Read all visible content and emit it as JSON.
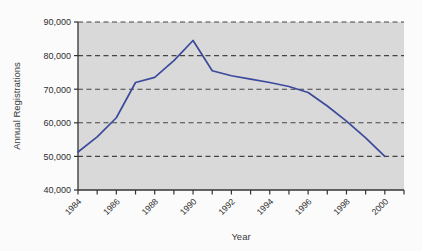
{
  "chart_data": {
    "type": "line",
    "title": "",
    "xlabel": "Year",
    "ylabel": "Annual Registrations",
    "xlim": [
      1984,
      2001
    ],
    "ylim": [
      40000,
      90000
    ],
    "grid": true,
    "grid_axis": "y",
    "legend": "none",
    "line_color": "#3b4a9c",
    "plot_background": "#d9d9d9",
    "figure_background": "#fbfbfb",
    "gridline_color": "#444444",
    "axis_color": "#333333",
    "x": [
      1984,
      1985,
      1986,
      1987,
      1988,
      1989,
      1990,
      1991,
      1992,
      1993,
      1994,
      1995,
      1996,
      1997,
      1998,
      1999,
      2000
    ],
    "values": [
      51300,
      55800,
      61500,
      72000,
      73500,
      78500,
      84500,
      75500,
      74000,
      73000,
      72000,
      70800,
      69000,
      65000,
      60500,
      55500,
      50000
    ],
    "ytick_values": [
      40000,
      50000,
      60000,
      70000,
      80000,
      90000
    ],
    "ytick_labels": [
      "40,000",
      "50,000",
      "60,000",
      "70,000",
      "80,000",
      "90,000"
    ],
    "xtick_values": [
      1984,
      1985,
      1986,
      1987,
      1988,
      1989,
      1990,
      1991,
      1992,
      1993,
      1994,
      1995,
      1996,
      1997,
      1998,
      1999,
      2000,
      2001
    ],
    "xtick_labeled": [
      1984,
      1986,
      1988,
      1990,
      1992,
      1994,
      1996,
      1998,
      2000
    ],
    "xtick_labels": [
      "1984",
      "1986",
      "1988",
      "1990",
      "1992",
      "1994",
      "1996",
      "1998",
      "2000"
    ],
    "xtick_label_rotation": -45
  }
}
